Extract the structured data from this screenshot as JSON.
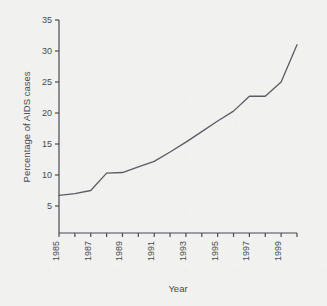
{
  "figure": {
    "background_color": "#f1f1f0",
    "ink_color": "#4a4a52",
    "line_color": "#5b5b66"
  },
  "chart_data": {
    "type": "line",
    "title": "",
    "xlabel": "Year",
    "ylabel": "Percentage of AIDS cases",
    "x": [
      1985,
      1986,
      1987,
      1988,
      1989,
      1990,
      1991,
      1992,
      1993,
      1994,
      1995,
      1996,
      1997,
      1998,
      1999,
      2000
    ],
    "values": [
      6.7,
      7.0,
      7.5,
      10.3,
      10.4,
      11.3,
      12.2,
      13.7,
      15.3,
      17.0,
      18.7,
      20.3,
      22.7,
      22.7,
      25.0,
      31.0
    ],
    "series": [
      {
        "name": "Percentage of AIDS cases",
        "values": [
          6.7,
          7.0,
          7.5,
          10.3,
          10.4,
          11.3,
          12.2,
          13.7,
          15.3,
          17.0,
          18.7,
          20.3,
          22.7,
          22.7,
          25.0,
          31.0
        ]
      }
    ],
    "xlim": [
      1985,
      2000
    ],
    "ylim": [
      0,
      35
    ],
    "yticks": [
      5,
      10,
      15,
      20,
      25,
      30,
      35
    ],
    "ytick_labels": [
      "5",
      "10",
      "15",
      "20",
      "25",
      "30",
      "35"
    ],
    "xticks": [
      1985,
      1986,
      1987,
      1988,
      1989,
      1990,
      1991,
      1992,
      1993,
      1994,
      1995,
      1996,
      1997,
      1998,
      1999,
      2000
    ],
    "xtick_labels": [
      "1985",
      "",
      "1987",
      "",
      "1989",
      "",
      "1991",
      "",
      "1993",
      "",
      "1995",
      "",
      "1997",
      "",
      "1999",
      ""
    ],
    "xtick_labels_shown": [
      "1985",
      "1987",
      "1989",
      "1991",
      "1993",
      "1995",
      "1997",
      "1999"
    ],
    "grid": false,
    "legend": false,
    "legend_position": "none",
    "spines": [
      "left",
      "bottom"
    ],
    "xtick_label_rotation": 90
  }
}
